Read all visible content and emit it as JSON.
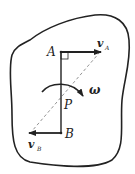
{
  "diagram": {
    "type": "rigid-body-velocity-diagram",
    "colors": {
      "ink": "#222222",
      "dashed": "#777777",
      "background": "#ffffff"
    },
    "points": {
      "A": {
        "label": "A"
      },
      "B": {
        "label": "B"
      },
      "P": {
        "label": "P"
      }
    },
    "vectors": {
      "vA": {
        "symbol": "v",
        "subscript": "A"
      },
      "vB": {
        "symbol": "v",
        "subscript": "B"
      }
    },
    "angular_velocity": {
      "symbol": "ω"
    }
  }
}
